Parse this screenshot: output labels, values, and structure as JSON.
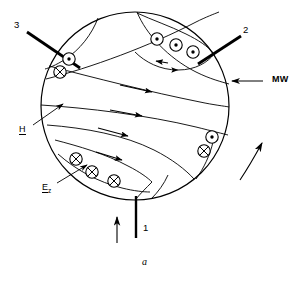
{
  "figure": {
    "caption": "a",
    "domain_type": "technical-schematic",
    "stroke_color": "#000000",
    "background": "#ffffff"
  },
  "geometry": {
    "circle": {
      "cx": 135,
      "cy": 106,
      "r": 94
    }
  },
  "labels": {
    "port1": "1",
    "port2": "2",
    "port3": "3",
    "wall": "MW",
    "h_field": "H",
    "e_field": "E",
    "e_field_subscript": "z"
  },
  "markers": {
    "out_of_page_symbol": "dot-circle",
    "into_page_symbol": "crossed-circle",
    "out_of_page": [
      {
        "x": 157,
        "y": 39
      },
      {
        "x": 176,
        "y": 45
      },
      {
        "x": 193,
        "y": 52
      },
      {
        "x": 69,
        "y": 59
      },
      {
        "x": 212,
        "y": 137
      }
    ],
    "into_page": [
      {
        "x": 60,
        "y": 72
      },
      {
        "x": 76,
        "y": 159
      },
      {
        "x": 92,
        "y": 172
      },
      {
        "x": 114,
        "y": 181
      },
      {
        "x": 204,
        "y": 151
      }
    ]
  },
  "arrows": {
    "port1_flow_label": "input-arrow-up",
    "rotation_label": "rotation-arrow",
    "mw_pointer_label": "mw-leader-arrow"
  },
  "label_positions": {
    "port3": {
      "x": 14,
      "y": 25
    },
    "port2": {
      "x": 243,
      "y": 30
    },
    "port1": {
      "x": 143,
      "y": 228
    },
    "wall": {
      "x": 272,
      "y": 85
    },
    "h_field": {
      "x": 19,
      "y": 130
    },
    "e_field": {
      "x": 42,
      "y": 188
    },
    "caption": {
      "x": 142,
      "y": 262
    }
  }
}
